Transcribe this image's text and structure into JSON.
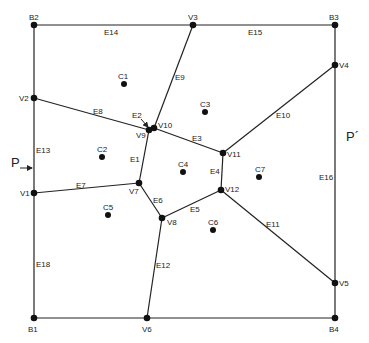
{
  "diagram": {
    "type": "voronoi-partition",
    "vertices": [
      {
        "id": "B1",
        "x": 34,
        "y": 318,
        "lx": 28,
        "ly": 332
      },
      {
        "id": "B2",
        "x": 34,
        "y": 25,
        "lx": 29,
        "ly": 20
      },
      {
        "id": "B3",
        "x": 335,
        "y": 25,
        "lx": 329,
        "ly": 20
      },
      {
        "id": "B4",
        "x": 335,
        "y": 318,
        "lx": 329,
        "ly": 332
      },
      {
        "id": "V1",
        "x": 34,
        "y": 193,
        "lx": 20,
        "ly": 196
      },
      {
        "id": "V2",
        "x": 34,
        "y": 98,
        "lx": 19,
        "ly": 101
      },
      {
        "id": "V3",
        "x": 193,
        "y": 25,
        "lx": 188,
        "ly": 20
      },
      {
        "id": "V4",
        "x": 335,
        "y": 65,
        "lx": 339,
        "ly": 68
      },
      {
        "id": "V5",
        "x": 335,
        "y": 283,
        "lx": 339,
        "ly": 286
      },
      {
        "id": "V6",
        "x": 147,
        "y": 318,
        "lx": 142,
        "ly": 332
      },
      {
        "id": "V7",
        "x": 139,
        "y": 183,
        "lx": 129,
        "ly": 194
      },
      {
        "id": "V8",
        "x": 162,
        "y": 218,
        "lx": 167,
        "ly": 225
      },
      {
        "id": "V9",
        "x": 149,
        "y": 130,
        "lx": 136,
        "ly": 138
      },
      {
        "id": "V10",
        "x": 154,
        "y": 128,
        "lx": 158,
        "ly": 128
      },
      {
        "id": "V11",
        "x": 223,
        "y": 153,
        "lx": 227,
        "ly": 157
      },
      {
        "id": "V12",
        "x": 221,
        "y": 190,
        "lx": 225,
        "ly": 192
      }
    ],
    "edges": [
      {
        "id": "E1",
        "from": "V9",
        "to": "V7",
        "lx": 130,
        "ly": 162
      },
      {
        "id": "E2",
        "from": "V9",
        "to": "V10",
        "lx": 132,
        "ly": 118
      },
      {
        "id": "E3",
        "from": "V10",
        "to": "V11",
        "lx": 192,
        "ly": 141
      },
      {
        "id": "E4",
        "from": "V11",
        "to": "V12",
        "lx": 210,
        "ly": 174
      },
      {
        "id": "E5",
        "from": "V12",
        "to": "V8",
        "lx": 190,
        "ly": 212
      },
      {
        "id": "E6",
        "from": "V7",
        "to": "V8",
        "lx": 153,
        "ly": 203
      },
      {
        "id": "E7",
        "from": "V1",
        "to": "V7",
        "lx": 76,
        "ly": 188
      },
      {
        "id": "E8",
        "from": "V2",
        "to": "V9",
        "lx": 93,
        "ly": 114
      },
      {
        "id": "E9",
        "from": "V10",
        "to": "V3",
        "lx": 175,
        "ly": 80
      },
      {
        "id": "E10",
        "from": "V11",
        "to": "V4",
        "lx": 276,
        "ly": 118
      },
      {
        "id": "E11",
        "from": "V12",
        "to": "V5",
        "lx": 266,
        "ly": 227
      },
      {
        "id": "E12",
        "from": "V8",
        "to": "V6",
        "lx": 156,
        "ly": 268
      },
      {
        "id": "E13",
        "from": "V2",
        "to": "V1",
        "lx": 36,
        "ly": 153
      },
      {
        "id": "E14",
        "from": "B2",
        "to": "V3",
        "lx": 104,
        "ly": 35
      },
      {
        "id": "E15",
        "from": "V3",
        "to": "B3",
        "lx": 248,
        "ly": 35
      },
      {
        "id": "E16",
        "from": "V4",
        "to": "V5",
        "lx": 319,
        "ly": 180
      },
      {
        "id": "E17",
        "from": "B3",
        "to": "V4",
        "lx": null,
        "ly": null
      },
      {
        "id": "E18",
        "from": "V1",
        "to": "B1",
        "lx": 36,
        "ly": 267
      },
      {
        "id": "E19",
        "from": "B1",
        "to": "V6",
        "lx": null,
        "ly": null
      },
      {
        "id": "E20",
        "from": "V6",
        "to": "B4",
        "lx": null,
        "ly": null
      },
      {
        "id": "E21",
        "from": "B4",
        "to": "V5",
        "lx": null,
        "ly": null
      },
      {
        "id": "E22",
        "from": "B2",
        "to": "V2",
        "lx": null,
        "ly": null
      }
    ],
    "cells": [
      {
        "id": "C1",
        "x": 124,
        "y": 84,
        "lx": 118,
        "ly": 79
      },
      {
        "id": "C2",
        "x": 102,
        "y": 157,
        "lx": 97,
        "ly": 152
      },
      {
        "id": "C3",
        "x": 205,
        "y": 112,
        "lx": 200,
        "ly": 107
      },
      {
        "id": "C4",
        "x": 183,
        "y": 172,
        "lx": 178,
        "ly": 167
      },
      {
        "id": "C5",
        "x": 108,
        "y": 215,
        "lx": 103,
        "ly": 210
      },
      {
        "id": "C6",
        "x": 213,
        "y": 230,
        "lx": 208,
        "ly": 225
      },
      {
        "id": "C7",
        "x": 259,
        "y": 177,
        "lx": 255,
        "ly": 172
      }
    ],
    "annotations": [
      {
        "id": "P",
        "text": "P",
        "x": 11,
        "y": 167
      },
      {
        "id": "P-prime",
        "text": "P´",
        "x": 346,
        "y": 141
      }
    ]
  }
}
